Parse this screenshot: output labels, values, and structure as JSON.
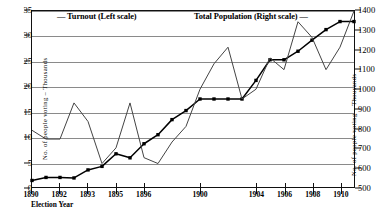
{
  "legend": {
    "turnout": "—  Turnout (Left scale)",
    "population": "Total Population (Right scale)  —"
  },
  "axes": {
    "x_title": "Election Year",
    "left_caption": "No. of people voting – Thousands",
    "right_caption": "No. of people voting – Thousands",
    "left_ticks": [
      "0",
      "5",
      "10",
      "15",
      "20",
      "25",
      "30",
      "35"
    ],
    "right_ticks": [
      "500",
      "600",
      "700",
      "800",
      "900",
      "1000",
      "1100",
      "1200",
      "1300",
      "1400"
    ],
    "x_ticks": [
      "1890",
      "1892",
      "1893",
      "1895",
      "1896",
      "1900",
      "1904",
      "1906",
      "1908",
      "1910"
    ]
  },
  "colors": {
    "frame": "#111111",
    "grid": "#8a8a8a",
    "turnout_line": "#000000",
    "population_line": "#444444"
  },
  "chart_data": {
    "type": "line",
    "title": "",
    "subtitle": "",
    "xlabel": "Election Year",
    "ylabel": "No. of people voting – Thousands",
    "y2label": "No. of people voting – Thousands",
    "ylim": [
      0,
      35
    ],
    "y2lim": [
      500,
      1400
    ],
    "grid": true,
    "legend_position": "top",
    "x_tick_labels": [
      "1890",
      "1892",
      "1893",
      "1895",
      "1896",
      "1900",
      "1904",
      "1906",
      "1908",
      "1910"
    ],
    "x_tick_positions": [
      0,
      2,
      4,
      6,
      8,
      12,
      16,
      18,
      20,
      22
    ],
    "x": [
      0,
      1,
      2,
      3,
      4,
      5,
      6,
      7,
      8,
      9,
      10,
      11,
      12,
      13,
      14,
      15,
      16,
      17,
      18,
      19,
      20,
      21,
      22,
      23
    ],
    "series": [
      {
        "name": "Turnout (Left scale)",
        "axis": "left",
        "units": "thousands",
        "markers": "square",
        "values": [
          1.3,
          1.9,
          1.9,
          1.8,
          3.4,
          4.1,
          6.6,
          5.8,
          8.6,
          10.4,
          13.4,
          15.2,
          17.5,
          17.5,
          17.5,
          17.5,
          21.2,
          25.3,
          25.3,
          27.0,
          29.2,
          31.3,
          32.9,
          32.9
        ]
      },
      {
        "name": "Total Population (Right scale)",
        "axis": "right",
        "units": "thousands",
        "markers": "none",
        "values": [
          790,
          745,
          745,
          930,
          835,
          620,
          700,
          930,
          650,
          620,
          730,
          810,
          1000,
          1130,
          1215,
          950,
          1000,
          1160,
          1100,
          1345,
          1265,
          1100,
          1215,
          1400
        ]
      }
    ]
  }
}
